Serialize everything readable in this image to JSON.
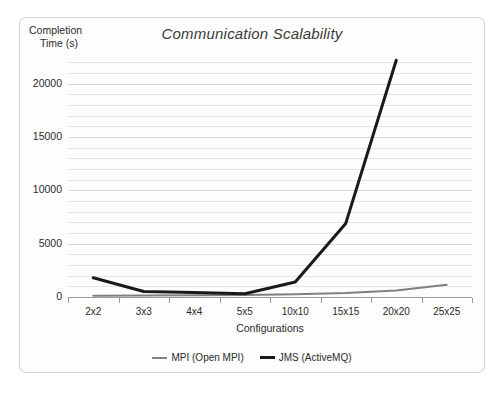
{
  "chart_data": {
    "type": "line",
    "title": "Communication Scalability",
    "xlabel": "Configurations",
    "ylabel": "Completion Time (s)",
    "ylabel_line1": "Completion",
    "ylabel_line2": "Time (s)",
    "categories": [
      "2x2",
      "3x3",
      "4x4",
      "5x5",
      "10x10",
      "15x15",
      "20x20",
      "25x25"
    ],
    "series": [
      {
        "name": "MPI (Open MPI)",
        "color": "#808080",
        "values": [
          120,
          150,
          170,
          190,
          260,
          380,
          620,
          1150
        ]
      },
      {
        "name": "JMS (ActiveMQ)",
        "color": "#1a1a1a",
        "values": [
          1800,
          520,
          420,
          300,
          1400,
          6900,
          22200,
          null
        ]
      }
    ],
    "ylim": [
      0,
      22500
    ],
    "yticks": [
      0,
      5000,
      10000,
      15000,
      20000
    ],
    "ytick_labels": [
      "0",
      "5000",
      "10000",
      "15000",
      "20000"
    ],
    "minor_gridlines": true,
    "minor_tick_step": 1000,
    "grid": true,
    "legend_position": "bottom",
    "legend": [
      "MPI (Open MPI)",
      "JMS (ActiveMQ)"
    ]
  },
  "colors": {
    "grid_major": "#d8d8d8",
    "grid_minor": "#e3e3e3",
    "axis": "#9a9a9a",
    "border": "#d2d2d2",
    "text": "#2b2b2b",
    "title": "#3b3b3b",
    "mpi": "#808080",
    "jms": "#1a1a1a"
  }
}
